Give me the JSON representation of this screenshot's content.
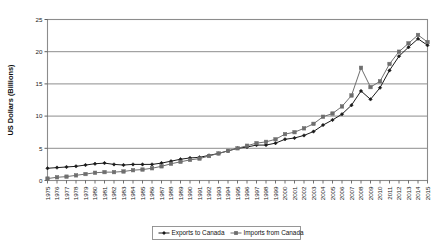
{
  "chart_data": {
    "type": "line",
    "title": "",
    "xlabel": "",
    "ylabel": "US Dollars (Billions)",
    "ylim": [
      0,
      25
    ],
    "yticks": [
      0,
      5,
      10,
      15,
      20,
      25
    ],
    "ytick_labels": [
      "0",
      "5",
      "10",
      "15",
      "20",
      "25"
    ],
    "grid": true,
    "grid_axis": "y",
    "legend_position": "bottom",
    "x": [
      1975,
      1976,
      1977,
      1978,
      1979,
      1980,
      1981,
      1982,
      1983,
      1984,
      1985,
      1986,
      1987,
      1988,
      1989,
      1990,
      1991,
      1992,
      1993,
      1994,
      1995,
      1996,
      1997,
      1998,
      1999,
      2000,
      2001,
      2002,
      2003,
      2004,
      2005,
      2006,
      2007,
      2008,
      2009,
      2010,
      2011,
      2012,
      2013,
      2014,
      2015
    ],
    "xtick_labels": [
      "1975",
      "1976",
      "1977",
      "1978",
      "1979",
      "1980",
      "1981",
      "1982",
      "1983",
      "1984",
      "1985",
      "1986",
      "1987",
      "1988",
      "1989",
      "1990",
      "1991",
      "1992",
      "1993",
      "1994",
      "1995",
      "1996",
      "1997",
      "1998",
      "1999",
      "2000",
      "2001",
      "2002",
      "2003",
      "2004",
      "2005",
      "2006",
      "2007",
      "2008",
      "2009",
      "2010",
      "2011",
      "2012",
      "2013",
      "2014",
      "2015"
    ],
    "series": [
      {
        "name": "Exports to Canada",
        "marker": "diamond",
        "color": "#1a1a1a",
        "values": [
          1.9,
          2.0,
          2.1,
          2.2,
          2.4,
          2.6,
          2.7,
          2.5,
          2.4,
          2.5,
          2.5,
          2.5,
          2.7,
          3.0,
          3.3,
          3.5,
          3.6,
          3.9,
          4.2,
          4.6,
          5.0,
          5.2,
          5.5,
          5.5,
          5.8,
          6.4,
          6.6,
          7.0,
          7.6,
          8.6,
          9.4,
          10.3,
          11.7,
          13.9,
          12.6,
          14.4,
          17.1,
          19.3,
          20.7,
          22.0,
          21.0
        ]
      },
      {
        "name": "Imports from Canada",
        "marker": "square",
        "color": "#6e6e6e",
        "values": [
          0.3,
          0.5,
          0.6,
          0.8,
          1.0,
          1.2,
          1.3,
          1.3,
          1.4,
          1.6,
          1.7,
          1.9,
          2.2,
          2.6,
          2.9,
          3.2,
          3.4,
          3.8,
          4.2,
          4.6,
          5.0,
          5.4,
          5.8,
          6.0,
          6.4,
          7.2,
          7.5,
          8.1,
          8.8,
          9.9,
          10.4,
          11.5,
          13.2,
          17.5,
          14.5,
          15.4,
          18.1,
          20.0,
          21.3,
          22.6,
          21.5
        ]
      }
    ]
  },
  "legend": {
    "items": [
      {
        "label": "Exports to Canada",
        "marker": "diamond",
        "color": "#1a1a1a"
      },
      {
        "label": "Imports from Canada",
        "marker": "square",
        "color": "#6e6e6e"
      }
    ]
  }
}
